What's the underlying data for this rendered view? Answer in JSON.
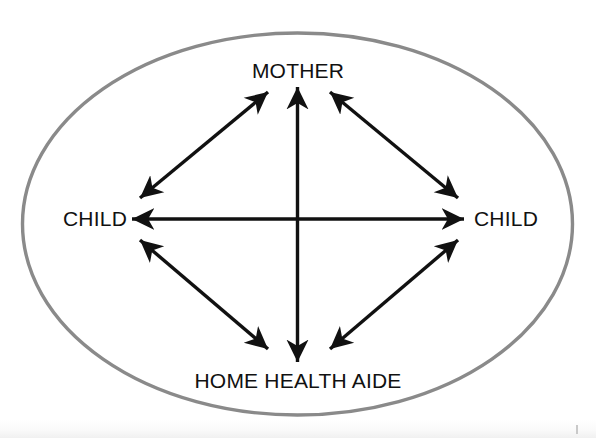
{
  "diagram": {
    "type": "relationship-network",
    "container_shape": "ellipse",
    "container_stroke_color": "#8a8a8a",
    "arrow_color": "#111111",
    "background_color": "#ffffff",
    "nodes": [
      {
        "id": "mother",
        "label": "MOTHER",
        "position": "top",
        "x": 298,
        "y": 70
      },
      {
        "id": "child-left",
        "label": "CHILD",
        "position": "left",
        "x": 95,
        "y": 218
      },
      {
        "id": "child-right",
        "label": "CHILD",
        "position": "right",
        "x": 506,
        "y": 218
      },
      {
        "id": "home-health-aide",
        "label": "HOME HEALTH AIDE",
        "position": "bottom",
        "x": 298,
        "y": 380
      }
    ],
    "edges": [
      {
        "id": "mother-childleft",
        "from": "mother",
        "to": "child-left",
        "arrow": "double"
      },
      {
        "id": "mother-childright",
        "from": "mother",
        "to": "child-right",
        "arrow": "double"
      },
      {
        "id": "childleft-aide",
        "from": "child-left",
        "to": "home-health-aide",
        "arrow": "double"
      },
      {
        "id": "childright-aide",
        "from": "child-right",
        "to": "home-health-aide",
        "arrow": "double"
      },
      {
        "id": "childleft-childright",
        "from": "child-left",
        "to": "child-right",
        "arrow": "double"
      },
      {
        "id": "mother-aide",
        "from": "mother",
        "to": "home-health-aide",
        "arrow": "double"
      }
    ]
  }
}
